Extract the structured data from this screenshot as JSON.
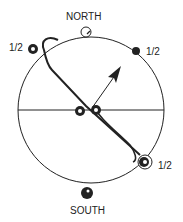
{
  "diagram": {
    "labels": {
      "north": "NORTH",
      "south": "SOUTH",
      "half_upper_left": "1/2",
      "half_upper_right": "1/2",
      "half_lower_right": "1/2"
    },
    "colors": {
      "line": "#222222",
      "background": "#ffffff"
    }
  }
}
